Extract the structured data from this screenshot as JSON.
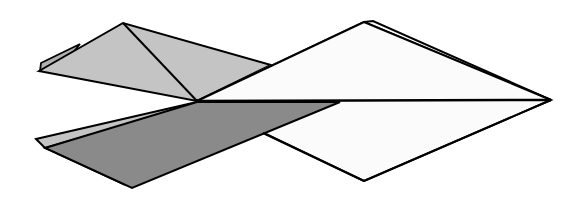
{
  "diagram": {
    "title": "Folded paper shape",
    "colors": {
      "background": "#ffffff",
      "white_face": "#fbfbfb",
      "light_gray_face": "#c4c4c4",
      "dark_gray_face": "#8a8a8a",
      "outline": "#000000"
    },
    "shapes": [
      {
        "name": "back-white-layer",
        "fill": "white_face",
        "points": "197,101 373,21 551,100"
      },
      {
        "name": "white-rhombus",
        "fill": "white_face",
        "points": "197,101 364,22 551,100 364,181"
      },
      {
        "name": "back-left-flap",
        "fill": "light_gray_face",
        "points": "41,63 80,44 60,64"
      },
      {
        "name": "upper-left-kite",
        "fill": "light_gray_face",
        "points": "39,71 123,23 271,65 197,101"
      },
      {
        "name": "lower-sliver",
        "fill": "light_gray_face",
        "points": "36,139 197,102 190,106 45,148"
      },
      {
        "name": "lower-dark-wing",
        "fill": "dark_gray_face",
        "points": "45,148 190,106 340,102 132,188"
      }
    ]
  }
}
